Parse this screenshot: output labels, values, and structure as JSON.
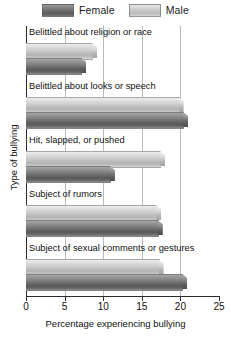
{
  "legend": {
    "position": "top-center",
    "entries": [
      {
        "label": "Female",
        "color": "#6e6e6e",
        "key": "female"
      },
      {
        "label": "Male",
        "color": "#c6c6c6",
        "key": "male"
      }
    ]
  },
  "axes": {
    "xlabel": "Percentage experiencing bullying",
    "ylabel": "Type of bullying",
    "xticks": [
      "0",
      "5",
      "10",
      "15",
      "20",
      "25"
    ],
    "xtick_values": [
      0,
      5,
      10,
      15,
      20,
      25
    ],
    "xmin": 0,
    "xmax": 25
  },
  "categories": [
    "Belittled about religion or race",
    "Belittled about looks or speech",
    "Hit, slapped, or pushed",
    "Subject of rumors",
    "Subject of sexual comments or gestures"
  ],
  "chart_data": {
    "type": "bar",
    "orientation": "horizontal",
    "title": "",
    "subtitle": "",
    "xlabel": "Percentage experiencing bullying",
    "ylabel": "Type of bullying",
    "xlim": [
      0,
      25
    ],
    "grid": true,
    "grid_axis": "x",
    "legend_position": "top-center",
    "categories": [
      "Belittled about religion or race",
      "Belittled about looks or speech",
      "Hit, slapped, or pushed",
      "Subject of rumors",
      "Subject of sexual comments or gestures"
    ],
    "series": [
      {
        "name": "Male",
        "color": "#c6c6c6",
        "values": [
          8.7,
          19.9,
          17.5,
          17.0,
          17.3
        ]
      },
      {
        "name": "Female",
        "color": "#6e6e6e",
        "values": [
          7.3,
          20.5,
          11.0,
          17.2,
          20.4
        ]
      }
    ],
    "xticks": [
      0,
      5,
      10,
      15,
      20,
      25
    ]
  }
}
